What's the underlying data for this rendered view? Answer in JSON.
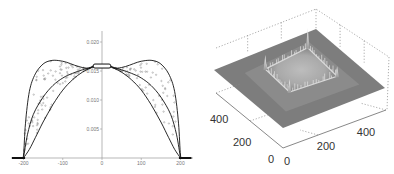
{
  "chart_data": [
    {
      "type": "line",
      "title": "",
      "xlabel": "",
      "ylabel": "",
      "xlim": [
        -230,
        230
      ],
      "ylim": [
        0,
        0.026
      ],
      "grid": false,
      "legend": null,
      "x_ticks": [
        -200,
        -100,
        0,
        100,
        200
      ],
      "x_tick_labels": [
        "-200",
        "-100",
        "0",
        "100",
        "200"
      ],
      "y_ticks": [
        0.005,
        0.01,
        0.015,
        0.02
      ],
      "y_tick_labels": [
        "0.005",
        "0.010",
        "0.015",
        "0.020"
      ],
      "series": [
        {
          "name": "outer curve",
          "style": "solid",
          "x": [
            -230,
            -205,
            -200,
            -195,
            -185,
            -170,
            -150,
            -130,
            -110,
            -90,
            -70,
            -50,
            -30,
            -20,
            0,
            20,
            30,
            50,
            70,
            90,
            110,
            130,
            150,
            170,
            185,
            195,
            200,
            205,
            230
          ],
          "y": [
            0,
            0,
            0.0005,
            0.006,
            0.0115,
            0.0145,
            0.0162,
            0.0168,
            0.0168,
            0.0165,
            0.016,
            0.0156,
            0.0155,
            0.016,
            0.016,
            0.016,
            0.0155,
            0.0156,
            0.016,
            0.0165,
            0.0168,
            0.0168,
            0.0162,
            0.0145,
            0.0115,
            0.006,
            0.0005,
            0,
            0
          ]
        },
        {
          "name": "middle curve",
          "style": "solid",
          "x": [
            -200,
            -190,
            -175,
            -150,
            -125,
            -100,
            -75,
            -50,
            -30,
            -20,
            20,
            30,
            50,
            75,
            100,
            125,
            150,
            175,
            190,
            200
          ],
          "y": [
            0,
            0.004,
            0.0075,
            0.0105,
            0.0125,
            0.0138,
            0.0146,
            0.0152,
            0.0156,
            0.0157,
            0.0157,
            0.0156,
            0.0152,
            0.0146,
            0.0138,
            0.0125,
            0.0105,
            0.0075,
            0.004,
            0
          ]
        },
        {
          "name": "inner curve",
          "style": "solid",
          "x": [
            -200,
            -185,
            -170,
            -150,
            -125,
            -100,
            -75,
            -50,
            -30,
            -20,
            20,
            30,
            50,
            75,
            100,
            125,
            150,
            170,
            185,
            200
          ],
          "y": [
            0,
            0.0015,
            0.0035,
            0.0062,
            0.0092,
            0.0117,
            0.0135,
            0.0148,
            0.0155,
            0.0157,
            0.0157,
            0.0155,
            0.0148,
            0.0135,
            0.0117,
            0.0092,
            0.0062,
            0.0035,
            0.0015,
            0
          ]
        },
        {
          "name": "scatter points",
          "style": "markers",
          "note": "dense small open-circle markers filling the band between outer and inner curves"
        }
      ]
    },
    {
      "type": "surface3d",
      "title": "",
      "x_ticks": [
        0,
        200,
        400
      ],
      "x_tick_labels": [
        "0",
        "200",
        "400"
      ],
      "y_ticks": [
        0,
        200,
        400
      ],
      "y_tick_labels": [
        "0",
        "200",
        "400"
      ],
      "z_ticks": [],
      "grid": true,
      "colormap": "gray",
      "description": "flat gray plane with a raised square plateau in the center; sharp spikes at the four corners of the plateau and noisy ridges along its edges"
    }
  ],
  "colors": {
    "line": "#111111",
    "marker": "#888888",
    "axis": "#999999",
    "surface_base": "#7d7d7d",
    "surface_highlight": "#e8e8e8",
    "box_dotted": "#8a8a8a"
  }
}
